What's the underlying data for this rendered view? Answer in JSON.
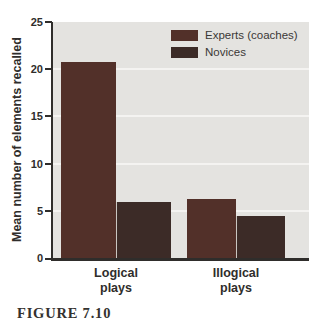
{
  "figure": {
    "caption": "FIGURE 7.10"
  },
  "chart_data": {
    "type": "bar",
    "title": "",
    "xlabel": "",
    "ylabel": "Mean number of elements recalled",
    "ylim": [
      0,
      25
    ],
    "yticks": [
      "25",
      "20",
      "15",
      "10",
      "5",
      "0"
    ],
    "grid": "horizontal light gridlines every 5 units",
    "legend_position": "top-right inside plot",
    "categories": [
      "Logical plays",
      "Illogical plays"
    ],
    "categories_multiline": [
      "Logical\nplays",
      "Illogical\nplays"
    ],
    "series": [
      {
        "name": "Experts (coaches)",
        "color": "#523029",
        "values": [
          20.8,
          6.3
        ]
      },
      {
        "name": "Novices",
        "color": "#3c2b27",
        "values": [
          5.9,
          4.4
        ]
      }
    ],
    "colors": {
      "plot_background": "#e4e3e0",
      "gridline": "#f4f3f1",
      "axis": "#2f2d2b",
      "text": "#2f2d2b"
    }
  }
}
